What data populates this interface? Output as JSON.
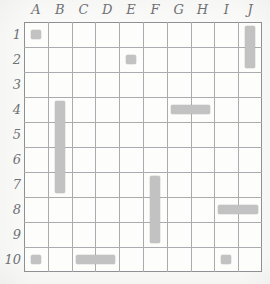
{
  "board": {
    "title": "Battleship grid",
    "columns": [
      "A",
      "B",
      "C",
      "D",
      "E",
      "F",
      "G",
      "H",
      "I",
      "J"
    ],
    "rows": [
      "1",
      "2",
      "3",
      "4",
      "5",
      "6",
      "7",
      "8",
      "9",
      "10"
    ],
    "grid_size": {
      "cols": 10,
      "rows": 10
    },
    "colors": {
      "paper": "#fbfbfa",
      "cell": "#fdfdfc",
      "grid_line": "#a9abae",
      "border": "#8f9094",
      "ship": "#c2c2c2",
      "label": "#6f7174"
    },
    "ships": [
      {
        "id": "ship-a1",
        "label": "A1",
        "col": 0,
        "row": 0,
        "length": 1,
        "orientation": "single"
      },
      {
        "id": "ship-j1-j2",
        "label": "J1-J2",
        "col": 9,
        "row": 0,
        "length": 2,
        "orientation": "vertical"
      },
      {
        "id": "ship-e2",
        "label": "E2",
        "col": 4,
        "row": 1,
        "length": 1,
        "orientation": "single"
      },
      {
        "id": "ship-b4-b7",
        "label": "B4-B7",
        "col": 1,
        "row": 3,
        "length": 4,
        "orientation": "vertical"
      },
      {
        "id": "ship-g4-h4",
        "label": "G4-H4",
        "col": 6,
        "row": 3,
        "length": 2,
        "orientation": "horizontal"
      },
      {
        "id": "ship-f7-f9",
        "label": "F7-F9",
        "col": 5,
        "row": 6,
        "length": 3,
        "orientation": "vertical"
      },
      {
        "id": "ship-i8-j8",
        "label": "I8-J8",
        "col": 8,
        "row": 7,
        "length": 2,
        "orientation": "horizontal"
      },
      {
        "id": "ship-a10",
        "label": "A10",
        "col": 0,
        "row": 9,
        "length": 1,
        "orientation": "single"
      },
      {
        "id": "ship-c10-d10",
        "label": "C10-D10",
        "col": 2,
        "row": 9,
        "length": 2,
        "orientation": "horizontal"
      },
      {
        "id": "ship-i10",
        "label": "I10",
        "col": 8,
        "row": 9,
        "length": 1,
        "orientation": "single"
      }
    ]
  }
}
